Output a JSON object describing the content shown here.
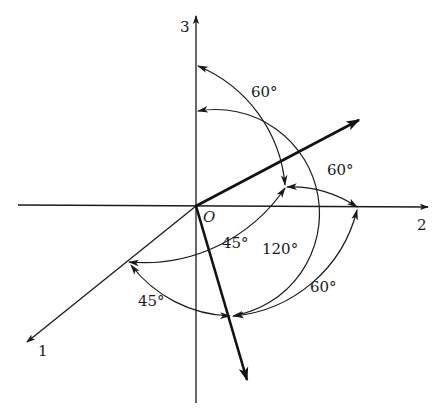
{
  "diagram": {
    "origin_label": "O",
    "axes": [
      {
        "id": "axis-1",
        "label": "1"
      },
      {
        "id": "axis-2",
        "label": "2"
      },
      {
        "id": "axis-3",
        "label": "3"
      }
    ],
    "angles": [
      {
        "id": "angle-upper-3",
        "label": "60°",
        "between": "vector-a and axis-3"
      },
      {
        "id": "angle-upper-2",
        "label": "60°",
        "between": "vector-a and axis-2"
      },
      {
        "id": "angle-upper-1",
        "label": "45°",
        "between": "vector-a and axis-1"
      },
      {
        "id": "angle-lower-3",
        "label": "120°",
        "between": "vector-b and axis-3"
      },
      {
        "id": "angle-lower-2",
        "label": "60°",
        "between": "vector-b and axis-2"
      },
      {
        "id": "angle-lower-1",
        "label": "45°",
        "between": "vector-b and axis-1"
      }
    ],
    "colors": {
      "ink": "#1a1a1a",
      "background": "#ffffff"
    }
  }
}
